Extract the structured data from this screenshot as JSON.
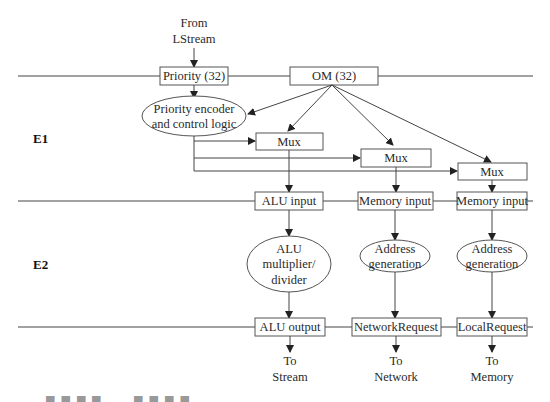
{
  "diagram": {
    "stages": {
      "e1": "E1",
      "e2": "E2"
    },
    "inputs": {
      "from_line1": "From",
      "from_line2": "LStream"
    },
    "registers_top": {
      "priority": "Priority (32)",
      "om": "OM (32)"
    },
    "logic": {
      "priority_encoder_line1": "Priority encoder",
      "priority_encoder_line2": "and control logic"
    },
    "muxes": [
      "Mux",
      "Mux",
      "Mux"
    ],
    "registers_mid": [
      "ALU input",
      "Memory input",
      "Memory input"
    ],
    "units": [
      {
        "lines": [
          "ALU",
          "multiplier/",
          "divider"
        ]
      },
      {
        "lines": [
          "Address",
          "generation"
        ]
      },
      {
        "lines": [
          "Address",
          "generation"
        ]
      }
    ],
    "registers_bottom": [
      "ALU output",
      "NetworkRequest",
      "LocalRequest"
    ],
    "outputs": [
      {
        "line1": "To",
        "line2": "Stream"
      },
      {
        "line1": "To",
        "line2": "Network"
      },
      {
        "line1": "To",
        "line2": "Memory"
      }
    ]
  },
  "colors": {
    "line": "#444444",
    "box_stroke": "#555555",
    "text": "#2a2a2a"
  }
}
